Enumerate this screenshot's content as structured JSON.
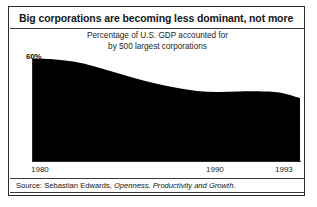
{
  "figure": {
    "title": "Big corporations are becoming less dominant, not more",
    "subtitle_line1": "Percentage of U.S. GDP accounted for",
    "subtitle_line2": "by 500 largest corporations",
    "source_prefix": "Source: Sebastian Edwards,",
    "source_work": "Openness, Productivity and Growth",
    "source_suffix": ".",
    "start_label": "60%",
    "end_label": "37%",
    "fill_color": "#000000",
    "frame_color": "#2b2b2b",
    "background": "#ffffff"
  },
  "chart_data": {
    "type": "area",
    "title": "Big corporations are becoming less dominant, not more",
    "subtitle": "Percentage of U.S. GDP accounted for by 500 largest corporations",
    "xlabel": "",
    "ylabel": "Percentage of U.S. GDP",
    "xlim": [
      1980,
      1993
    ],
    "ylim": [
      0,
      62
    ],
    "grid": false,
    "legend": null,
    "tick_labels_x": [
      "1980",
      "1990",
      "1993"
    ],
    "tick_values_x": [
      1980,
      1990,
      1993
    ],
    "annotations": [
      {
        "text": "60%",
        "x": 1980,
        "y": 60
      },
      {
        "text": "37%",
        "x": 1993,
        "y": 37
      }
    ],
    "x": [
      1980,
      1981,
      1982,
      1983,
      1984,
      1985,
      1986,
      1987,
      1988,
      1989,
      1990,
      1991,
      1992,
      1993
    ],
    "values": [
      60,
      59.6,
      58.2,
      55.5,
      52.0,
      48.5,
      45.5,
      43.0,
      41.2,
      40.6,
      40.9,
      41.0,
      40.2,
      37.0
    ],
    "series": [
      {
        "name": "Share of U.S. GDP from 500 largest corporations",
        "values": [
          60,
          59.6,
          58.2,
          55.5,
          52.0,
          48.5,
          45.5,
          43.0,
          41.2,
          40.6,
          40.9,
          41.0,
          40.2,
          37.0
        ]
      }
    ]
  }
}
